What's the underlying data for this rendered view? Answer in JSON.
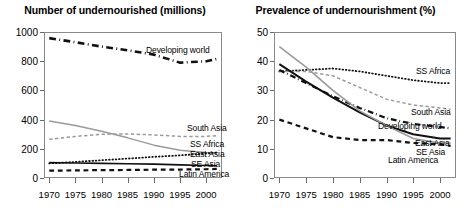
{
  "figure": {
    "panels": [
      {
        "id": "number",
        "title": "Number of undernourished (millions)",
        "chart_data": {
          "type": "line",
          "title": "Number of undernourished (millions)",
          "xlabel": "",
          "ylabel": "",
          "xlim": [
            1969,
            2003
          ],
          "ylim": [
            0,
            1000
          ],
          "xticks": [
            1970,
            1975,
            1980,
            1985,
            1990,
            1995,
            2000
          ],
          "yticks": [
            0,
            200,
            400,
            600,
            800,
            1000
          ],
          "grid": false,
          "legend": "inline-annotations",
          "x": [
            1970,
            1975,
            1980,
            1985,
            1990,
            1995,
            2000,
            2002
          ],
          "series": [
            {
              "name": "Developing world",
              "style": "dash-dot",
              "color": "#111111",
              "width": 2.6,
              "values": [
                958,
                930,
                900,
                875,
                845,
                790,
                800,
                815
              ]
            },
            {
              "name": "South Asia",
              "style": "dashed",
              "color": "#9a9a9a",
              "width": 1.5,
              "values": [
                265,
                285,
                300,
                302,
                295,
                285,
                285,
                290
              ]
            },
            {
              "name": "SS Africa",
              "style": "solid",
              "color": "#9a9a9a",
              "width": 1.5,
              "values": [
                390,
                360,
                320,
                275,
                225,
                190,
                175,
                172
              ]
            },
            {
              "name": "East Asia",
              "style": "dotted",
              "color": "#111111",
              "width": 1.8,
              "values": [
                100,
                110,
                122,
                133,
                145,
                155,
                168,
                175
              ]
            },
            {
              "name": "SE Asia",
              "style": "solid",
              "color": "#111111",
              "width": 1.6,
              "values": [
                105,
                103,
                100,
                98,
                95,
                90,
                86,
                84
              ]
            },
            {
              "name": "Latin America",
              "style": "dashed",
              "color": "#111111",
              "width": 2.2,
              "values": [
                50,
                52,
                54,
                55,
                57,
                58,
                60,
                62
              ]
            }
          ],
          "annotations": [
            {
              "text": "Developing world",
              "x": 1986,
              "y": 865
            },
            {
              "text": "South Asia",
              "x": 2001,
              "y": 330
            },
            {
              "text": "SS Africa",
              "x": 2001,
              "y": 235
            },
            {
              "text": "East Asia",
              "x": 2001,
              "y": 180
            },
            {
              "text": "SE Asia",
              "x": 2001,
              "y": 120
            },
            {
              "text": "Latin America",
              "x": 2001,
              "y": 60
            }
          ]
        }
      },
      {
        "id": "prevalence",
        "title": "Prevalence of undernourishment (%)",
        "chart_data": {
          "type": "line",
          "title": "Prevalence of undernourishment (%)",
          "xlabel": "",
          "ylabel": "",
          "xlim": [
            1969,
            2003
          ],
          "ylim": [
            0,
            50
          ],
          "xticks": [
            1970,
            1975,
            1980,
            1985,
            1990,
            1995,
            2000
          ],
          "yticks": [
            0,
            10,
            20,
            30,
            40,
            50
          ],
          "grid": false,
          "legend": "inline-annotations",
          "x": [
            1970,
            1975,
            1980,
            1985,
            1990,
            1995,
            2000,
            2002
          ],
          "series": [
            {
              "name": "SS Africa",
              "style": "dotted",
              "color": "#111111",
              "width": 1.8,
              "values": [
                36.5,
                37.0,
                37.5,
                36.5,
                35.0,
                33.5,
                32.5,
                32.5
              ]
            },
            {
              "name": "South Asia",
              "style": "dashed",
              "color": "#9a9a9a",
              "width": 1.5,
              "values": [
                36.5,
                36.5,
                35.0,
                31.0,
                27.0,
                25.0,
                24.0,
                23.5
              ]
            },
            {
              "name": "Developing world",
              "style": "dash-dot",
              "color": "#111111",
              "width": 2.2,
              "values": [
                37.0,
                32.5,
                28.0,
                24.0,
                20.5,
                18.5,
                17.5,
                17.0
              ]
            },
            {
              "name": "East Asia",
              "style": "solid",
              "color": "#111111",
              "width": 2.0,
              "values": [
                39.0,
                33.0,
                27.5,
                22.5,
                18.0,
                15.0,
                13.5,
                13.5
              ]
            },
            {
              "name": "SE Asia",
              "style": "solid",
              "color": "#9a9a9a",
              "width": 1.6,
              "values": [
                45.0,
                38.0,
                30.0,
                23.0,
                18.0,
                13.5,
                12.0,
                12.0
              ]
            },
            {
              "name": "Latin America",
              "style": "dashed",
              "color": "#111111",
              "width": 2.2,
              "values": [
                20.0,
                17.0,
                14.0,
                13.0,
                13.0,
                12.0,
                11.5,
                11.0
              ]
            }
          ],
          "annotations": [
            {
              "text": "SS Africa",
              "x": 2001,
              "y": 35.5
            },
            {
              "text": "South Asia",
              "x": 2001,
              "y": 22.5
            },
            {
              "text": "Developing world",
              "x": 1999,
              "y": 17.8
            },
            {
              "text": "East Asia",
              "x": 2001,
              "y": 12.0
            },
            {
              "text": "SE Asia",
              "x": 2001,
              "y": 9.0
            },
            {
              "text": "Latin America",
              "x": 2000,
              "y": 6.5
            }
          ]
        }
      }
    ]
  }
}
